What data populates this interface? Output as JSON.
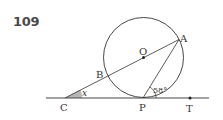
{
  "problem": {
    "number": "109"
  },
  "diagram": {
    "colors": {
      "stroke": "#333333",
      "angle_fill": "#b8b8b8"
    },
    "circle": {
      "center_label": "O",
      "cx": 143.5,
      "cy": 57.5,
      "r": 40
    },
    "points": {
      "A": {
        "label": "A",
        "x": 178,
        "y": 40
      },
      "B": {
        "label": "B",
        "x": 107,
        "y": 76
      },
      "C": {
        "label": "C",
        "x": 65,
        "y": 98
      },
      "O": {
        "label": "O",
        "x": 143.5,
        "y": 57.5
      },
      "P": {
        "label": "P",
        "x": 143,
        "y": 98
      },
      "T": {
        "label": "T",
        "x": 190,
        "y": 98
      }
    },
    "angles": {
      "x": {
        "label": "x",
        "vertex": "C"
      },
      "APT": {
        "label": "58°",
        "vertex": "P"
      }
    },
    "segments": [
      "C-A (through B, O)",
      "P-A",
      "tangent line C-P-T"
    ]
  }
}
